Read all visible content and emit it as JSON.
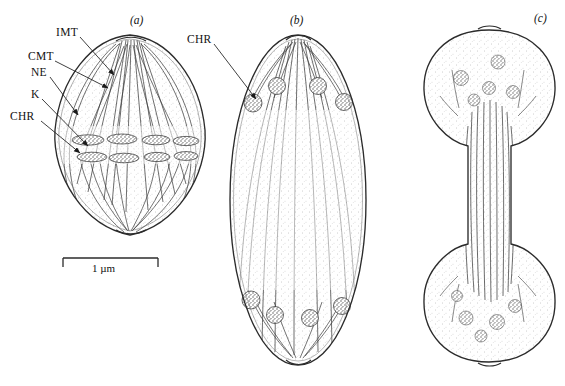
{
  "figure": {
    "caption_panels": [
      {
        "id": "a",
        "label": "(a)",
        "x": 130,
        "y": 14
      },
      {
        "id": "b",
        "label": "(b)",
        "x": 297,
        "y": 14
      },
      {
        "id": "c",
        "label": "(c)",
        "x": 536,
        "y": 12
      }
    ],
    "annotations": [
      {
        "key": "IMT",
        "label": "IMT",
        "x": 56,
        "y": 33,
        "target_x": 114,
        "target_y": 75,
        "meaning": "interdigitating-microtubules"
      },
      {
        "key": "CMT",
        "label": "CMT",
        "x": 28,
        "y": 57,
        "target_x": 108,
        "target_y": 88,
        "meaning": "continuous-microtubules"
      },
      {
        "key": "NE",
        "label": "NE",
        "x": 31,
        "y": 73,
        "target_x": 78,
        "target_y": 115,
        "meaning": "nuclear-envelope"
      },
      {
        "key": "K",
        "label": "K",
        "x": 31,
        "y": 95,
        "target_x": 88,
        "target_y": 146,
        "meaning": "kinetochore"
      },
      {
        "key": "CHR",
        "label": "CHR",
        "x": 10,
        "y": 117,
        "target_x": 80,
        "target_y": 153,
        "meaning": "chromatin"
      },
      {
        "key": "CHR_b",
        "label": "CHR",
        "x": 187,
        "y": 40,
        "target_x": 256,
        "target_y": 99,
        "meaning": "chromatin"
      }
    ],
    "scale_bar": {
      "label": "1 µm",
      "x1": 63,
      "x2": 158,
      "y": 258,
      "cap_height": 9,
      "text_x": 110,
      "text_y": 262
    },
    "colors": {
      "ink": "#222222",
      "line": "#3a3a3a",
      "stipple": "#8a8a8a",
      "background": "#ffffff"
    }
  },
  "diagram": {
    "title_semantic": "mitotic-spindle-stages",
    "panels": [
      {
        "id": "a",
        "shape": "lens",
        "stage": "metaphase-anaphase",
        "cx": 130,
        "cy": 135,
        "rx": 76,
        "ry": 101,
        "chromosome_clusters": 8
      },
      {
        "id": "b",
        "shape": "ellipse",
        "stage": "anaphase-elongation",
        "cx": 298,
        "cy": 200,
        "rx": 68,
        "ry": 165,
        "chromosome_clusters": 8
      },
      {
        "id": "c",
        "shape": "dumbbell",
        "stage": "telophase",
        "cx": 489,
        "cy": 195,
        "bulb_rx": 65,
        "bulb_ry": 55,
        "stalk_w": 44,
        "chromosome_clusters": 9
      }
    ]
  }
}
